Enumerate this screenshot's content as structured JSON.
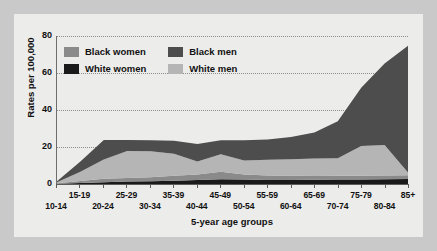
{
  "chart_data": {
    "type": "area",
    "stacked": true,
    "title": "",
    "xlabel": "5-year age groups",
    "ylabel": "Rates per 100,000",
    "ylim": [
      0,
      80
    ],
    "yticks": [
      0,
      20,
      40,
      60,
      80
    ],
    "grid": true,
    "legend_position": "top-left-inside",
    "categories": [
      "10-14",
      "15-19",
      "20-24",
      "25-29",
      "30-34",
      "35-39",
      "40-44",
      "45-49",
      "50-54",
      "55-59",
      "60-64",
      "65-69",
      "70-74",
      "75-79",
      "80-84",
      "85+"
    ],
    "series": [
      {
        "name": "White women",
        "color": "#1a1a1a",
        "values": [
          0.2,
          0.6,
          1.0,
          1.3,
          1.5,
          1.8,
          2.1,
          2.6,
          2.4,
          2.2,
          2.2,
          2.3,
          2.4,
          2.5,
          2.6,
          2.7
        ]
      },
      {
        "name": "Black women",
        "color": "#8a8a8a",
        "values": [
          0.2,
          1.0,
          1.8,
          2.0,
          2.2,
          2.6,
          3.0,
          4.0,
          2.8,
          2.4,
          2.2,
          2.0,
          2.0,
          2.0,
          2.0,
          2.0
        ]
      },
      {
        "name": "White men",
        "color": "#b5b5b5",
        "values": [
          0.6,
          5.0,
          10.5,
          14.5,
          14.0,
          12.0,
          7.0,
          9.5,
          7.5,
          8.5,
          9.0,
          9.5,
          9.5,
          16.0,
          16.5,
          1.5
        ]
      },
      {
        "name": "Black men",
        "color": "#4d4d4d",
        "values": [
          0.5,
          5.5,
          10.5,
          6.0,
          6.0,
          7.0,
          9.5,
          7.5,
          11.0,
          11.0,
          12.0,
          14.0,
          20.0,
          31.5,
          44.0,
          68.5
        ]
      }
    ],
    "series_order_bottom_to_top": [
      "White women",
      "Black women",
      "White men",
      "Black men"
    ]
  },
  "legend": {
    "items": [
      {
        "label": "Black women",
        "swatch": "#8a8a8a",
        "icon": "legend-swatch-icon"
      },
      {
        "label": "Black men",
        "swatch": "#4d4d4d",
        "icon": "legend-swatch-icon"
      },
      {
        "label": "White women",
        "swatch": "#1a1a1a",
        "icon": "legend-swatch-icon"
      },
      {
        "label": "White men",
        "swatch": "#b5b5b5",
        "icon": "legend-swatch-icon"
      }
    ]
  },
  "axes": {
    "y_title": "Rates per 100,000",
    "y_ticks": [
      "0",
      "20",
      "40",
      "60",
      "80"
    ],
    "x_title": "5-year age groups",
    "x_labels_upper": [
      "15-19",
      "25-29",
      "35-39",
      "45-49",
      "55-59",
      "65-69",
      "75-79",
      "85+"
    ],
    "x_labels_lower": [
      "10-14",
      "20-24",
      "30-34",
      "40-44",
      "50-54",
      "60-64",
      "70-74",
      "80-84"
    ]
  },
  "colors": {
    "background": "#c9c9c9",
    "panel": "#ececeb",
    "axis": "#5c5c5c",
    "grid": "#8d8d8d",
    "text": "#111111"
  }
}
